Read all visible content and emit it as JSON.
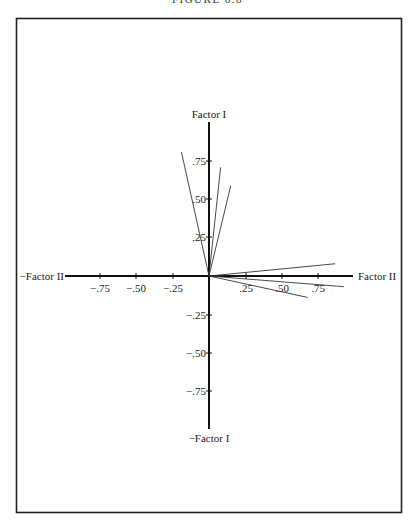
{
  "figure": {
    "title": "FIGURE 6.8"
  },
  "chart_data": {
    "type": "scatter",
    "subtype": "factor-loading-vector-plot",
    "title": "FIGURE 6.8",
    "xlabel": "Factor II",
    "xlabel_negative": "−Factor II",
    "ylabel": "Factor I",
    "ylabel_negative": "−Factor I",
    "xlim": [
      -1.0,
      1.0
    ],
    "ylim": [
      -1.0,
      1.0
    ],
    "x_ticks": [
      -0.75,
      -0.5,
      -0.25,
      0.25,
      0.5,
      0.75
    ],
    "x_tick_labels": [
      "−.75",
      "−.50",
      "−.25",
      ".25",
      ".50",
      ".75"
    ],
    "y_ticks": [
      0.75,
      0.5,
      0.25,
      -0.25,
      -0.5,
      -0.75
    ],
    "y_tick_labels": [
      ".75",
      ".50",
      ".25",
      "−.25",
      "−.50",
      "−.75"
    ],
    "grid": false,
    "legend": null,
    "vectors": [
      {
        "x": -0.19,
        "y": 0.81
      },
      {
        "x": 0.08,
        "y": 0.71
      },
      {
        "x": 0.15,
        "y": 0.59
      },
      {
        "x": 0.87,
        "y": 0.08
      },
      {
        "x": 0.93,
        "y": -0.07
      },
      {
        "x": 0.68,
        "y": -0.14
      }
    ]
  }
}
